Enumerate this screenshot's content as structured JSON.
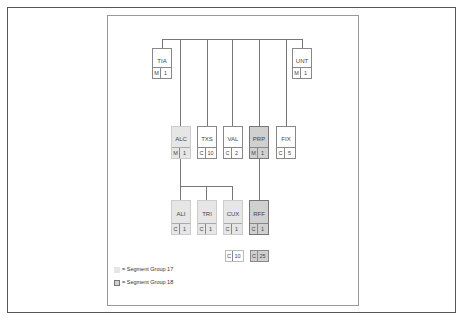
{
  "diagram": {
    "title": "",
    "segments": {
      "TIA": {
        "tag": "TIA",
        "status": "M",
        "repeat": "1",
        "group": ""
      },
      "UNT": {
        "tag": "UNT",
        "status": "M",
        "repeat": "1",
        "group": ""
      },
      "ALC": {
        "tag": "ALC",
        "status": "M",
        "repeat": "1",
        "group": "17"
      },
      "TXS": {
        "tag": "TXS",
        "status": "C",
        "repeat": "10",
        "group": ""
      },
      "VAL": {
        "tag": "VAL",
        "status": "C",
        "repeat": "2",
        "group": ""
      },
      "PRP": {
        "tag": "PRP",
        "status": "M",
        "repeat": "1",
        "group": "18"
      },
      "FIX": {
        "tag": "FIX",
        "status": "C",
        "repeat": "5",
        "group": ""
      },
      "ALI": {
        "tag": "ALI",
        "status": "C",
        "repeat": "1",
        "group": "17"
      },
      "TRI": {
        "tag": "TRI",
        "status": "C",
        "repeat": "1",
        "group": "17"
      },
      "CUX": {
        "tag": "CUX",
        "status": "C",
        "repeat": "1",
        "group": "17"
      },
      "RFF": {
        "tag": "RFF",
        "status": "C",
        "repeat": "1",
        "group": "18"
      }
    },
    "group_counts": [
      {
        "group": "17",
        "status": "C",
        "repeat": "10"
      },
      {
        "group": "18",
        "status": "C",
        "repeat": "25"
      }
    ],
    "edges": [
      [
        "root",
        "TIA"
      ],
      [
        "root",
        "ALC"
      ],
      [
        "root",
        "TXS"
      ],
      [
        "root",
        "VAL"
      ],
      [
        "root",
        "PRP"
      ],
      [
        "root",
        "FIX"
      ],
      [
        "root",
        "UNT"
      ],
      [
        "ALC",
        "ALI"
      ],
      [
        "ALC",
        "TRI"
      ],
      [
        "ALC",
        "CUX"
      ],
      [
        "PRP",
        "RFF"
      ]
    ]
  },
  "legend": {
    "group17": "= Segment Group 17",
    "group18": "= Segment Group 18"
  }
}
